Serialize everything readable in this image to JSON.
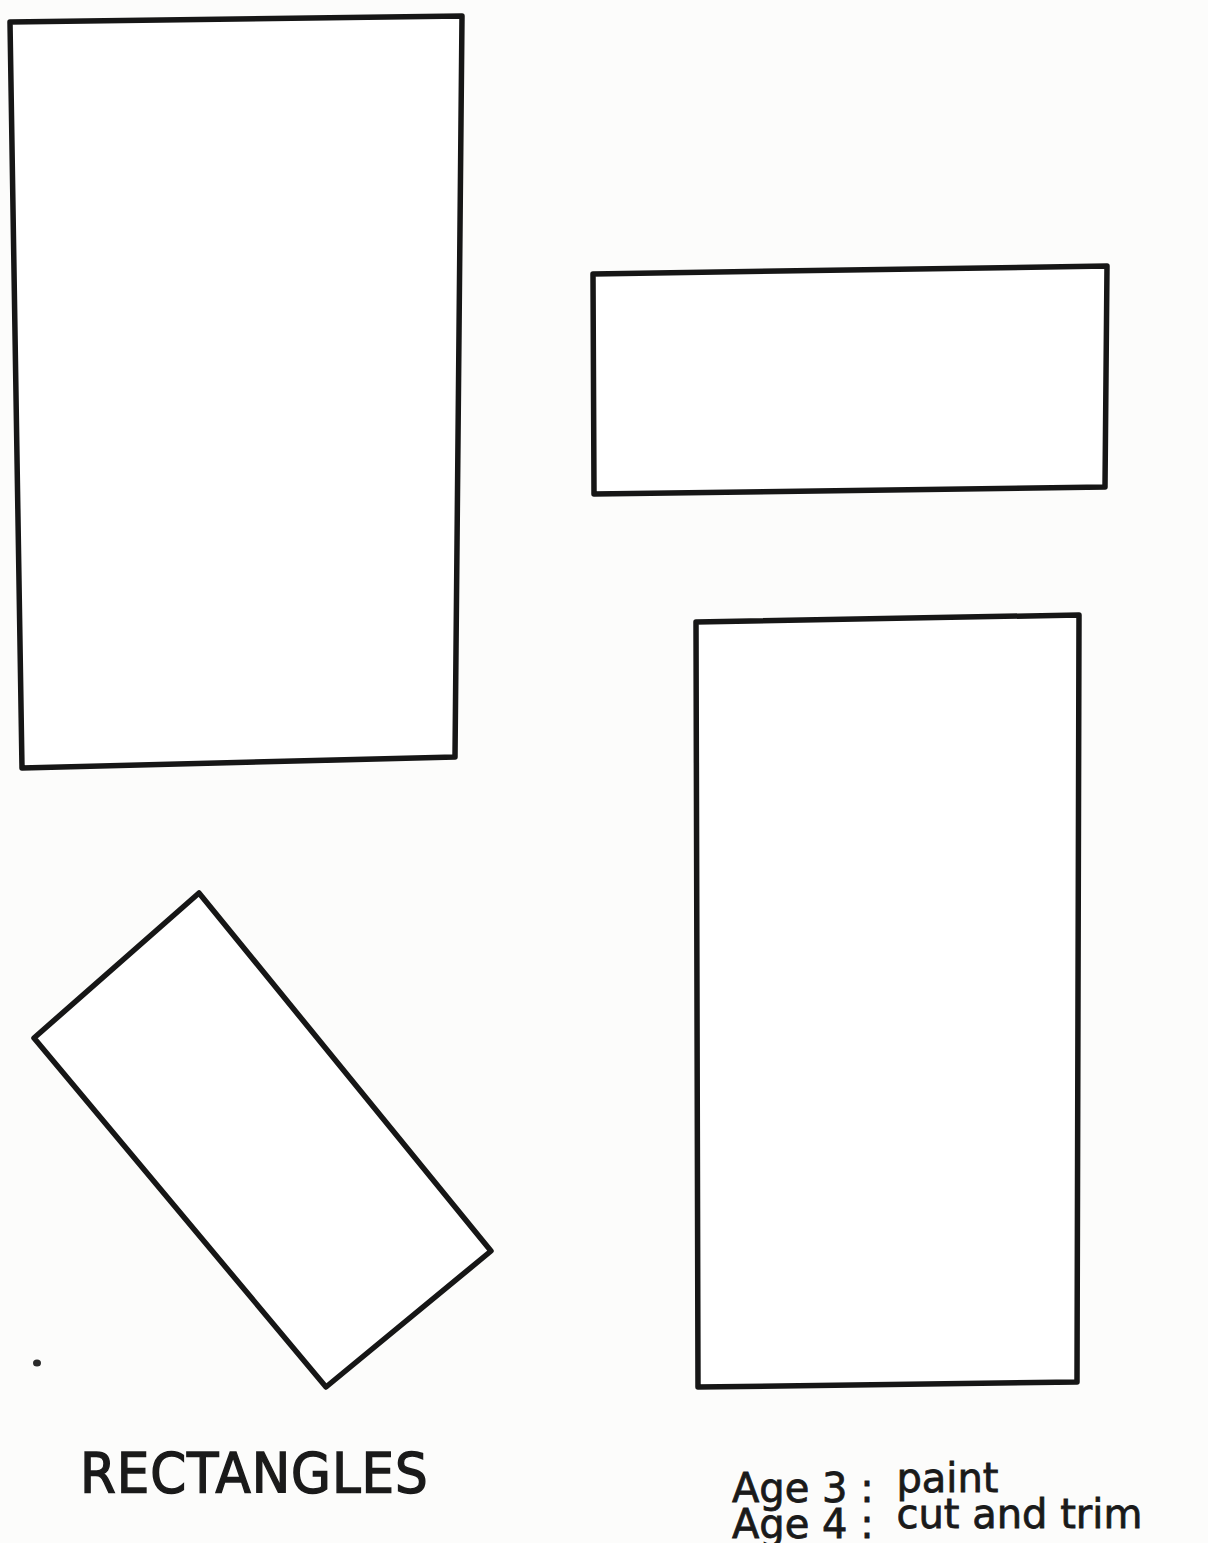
{
  "worksheet": {
    "title": "RECTANGLES",
    "shapes": [
      {
        "name": "tall-rectangle-top-left",
        "points": "10,22 462,16 455,757 22,768"
      },
      {
        "name": "wide-rectangle-top-right",
        "points": "593,274 1107,266 1105,487 594,494"
      },
      {
        "name": "rotated-rectangle-bottom-left",
        "points": "199,893 491,1251 326,1387 34,1038"
      },
      {
        "name": "tall-rectangle-bottom-right",
        "points": "696,622 1079,615 1077,1382 698,1387"
      }
    ],
    "notes": [
      {
        "age": "Age 3 :",
        "activity": "paint"
      },
      {
        "age": "Age 4 :",
        "activity": "cut and trim"
      }
    ]
  }
}
